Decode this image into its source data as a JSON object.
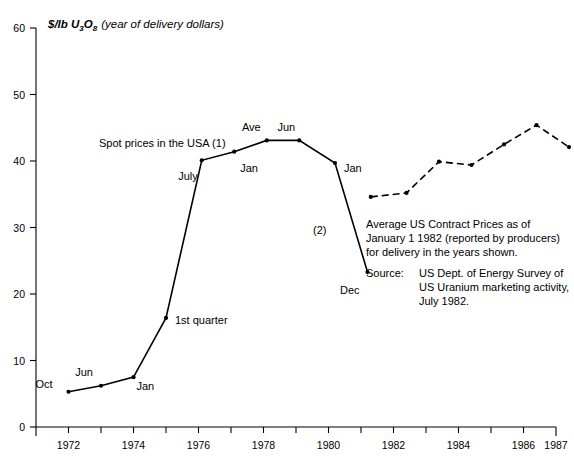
{
  "chart_data": {
    "type": "line",
    "title": "",
    "ylabel_parts": {
      "main": "$/lb U",
      "sub1": "3",
      "mid": "O",
      "sub2": "8",
      "tail": "(year of delivery dollars)"
    },
    "ylabel": "$/lb U3O8 (year of delivery dollars)",
    "xlabel": "",
    "xlim": [
      1971,
      1987
    ],
    "ylim": [
      0,
      60
    ],
    "grid": false,
    "legend_position": "inline-annotations",
    "yticks": [
      0,
      10,
      20,
      30,
      40,
      50,
      60
    ],
    "ytick_labels": [
      "0",
      "10",
      "20",
      "30",
      "40",
      "50",
      "60"
    ],
    "xticks": [
      1971,
      1972,
      1973,
      1974,
      1975,
      1976,
      1977,
      1978,
      1979,
      1980,
      1981,
      1982,
      1983,
      1984,
      1985,
      1986,
      1987
    ],
    "xtick_labels": [
      "1972",
      "1974",
      "1976",
      "1978",
      "1980",
      "1982",
      "1984",
      "1986",
      "1987"
    ],
    "xtick_label_values": [
      1972,
      1974,
      1976,
      1978,
      1980,
      1982,
      1984,
      1986,
      1987
    ],
    "series": [
      {
        "name": "Spot prices in the USA (1)",
        "style": "solid",
        "label_text": "Spot prices in the USA (1)",
        "points": [
          {
            "x": 1972.0,
            "y": 5.3,
            "label": "Oct",
            "lx": -16,
            "ly": -4
          },
          {
            "x": 1973.0,
            "y": 6.2,
            "label": "Jun",
            "lx": -8,
            "ly": -10
          },
          {
            "x": 1974.0,
            "y": 7.5,
            "label": "Jan",
            "lx": 3,
            "ly": 13
          },
          {
            "x": 1975.0,
            "y": 16.4,
            "label": "1st quarter",
            "lx": 9,
            "ly": 6
          },
          {
            "x": 1976.1,
            "y": 40.1,
            "label": "July",
            "lx": -4,
            "ly": 20
          },
          {
            "x": 1977.1,
            "y": 41.4,
            "label": "Jan",
            "lx": 6,
            "ly": 20
          },
          {
            "x": 1978.1,
            "y": 43.1,
            "label": "Ave",
            "lx": -6,
            "ly": -9
          },
          {
            "x": 1979.1,
            "y": 43.1,
            "label": "Jun",
            "lx": -4,
            "ly": -9
          },
          {
            "x": 1980.2,
            "y": 39.7,
            "label": "Jan",
            "lx": 9,
            "ly": 9
          },
          {
            "x": 1981.2,
            "y": 23.3,
            "label": "Dec",
            "lx": -8,
            "ly": 22
          }
        ]
      },
      {
        "name": "Average US Contract Prices (2)",
        "style": "dashed",
        "label_text": "(2)",
        "points": [
          {
            "x": 1981.3,
            "y": 34.6,
            "label": "",
            "lx": 0,
            "ly": 0
          },
          {
            "x": 1982.4,
            "y": 35.2,
            "label": "",
            "lx": 0,
            "ly": 0
          },
          {
            "x": 1983.4,
            "y": 39.9,
            "label": "",
            "lx": 0,
            "ly": 0
          },
          {
            "x": 1984.4,
            "y": 39.4,
            "label": "",
            "lx": 0,
            "ly": 0
          },
          {
            "x": 1985.4,
            "y": 42.5,
            "label": "",
            "lx": 0,
            "ly": 0
          },
          {
            "x": 1986.4,
            "y": 45.4,
            "label": "",
            "lx": 0,
            "ly": 0
          },
          {
            "x": 1987.4,
            "y": 42.1,
            "label": "",
            "lx": 0,
            "ly": 0
          }
        ]
      }
    ],
    "annotations": [
      {
        "name": "note-contract-prices",
        "lines": [
          "Average US Contract Prices as of",
          "January 1 1982 (reported by producers)",
          "for delivery in the years shown."
        ]
      },
      {
        "name": "note-source",
        "label": "Source:",
        "lines": [
          "US Dept. of Energy Survey of",
          "US Uranium marketing activity,",
          "July 1982."
        ]
      }
    ]
  },
  "colors": {
    "ink": "#000000",
    "background": "#ffffff"
  }
}
